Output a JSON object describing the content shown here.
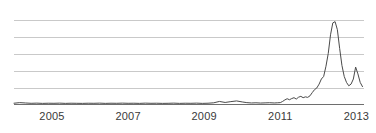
{
  "chart_data": {
    "type": "line",
    "title": "",
    "subtitle": "",
    "xlabel": "",
    "ylabel": "",
    "grid": true,
    "legend": null,
    "xlim": [
      2004.0,
      2013.2
    ],
    "ylim": [
      0,
      100
    ],
    "gridline_values": [
      100,
      80,
      60,
      40,
      20
    ],
    "xticks": [
      2005,
      2007,
      2009,
      2011,
      2013
    ],
    "xtick_labels": [
      "2005",
      "2007",
      "2009",
      "2011",
      "2013"
    ],
    "yticks": [],
    "ytick_labels": [],
    "series": [
      {
        "name": "value",
        "color": "#4a4a4a",
        "x": [
          2004.0,
          2004.15,
          2004.3,
          2004.45,
          2004.6,
          2004.75,
          2004.9,
          2005.05,
          2005.2,
          2005.35,
          2005.5,
          2005.65,
          2005.8,
          2005.95,
          2006.1,
          2006.25,
          2006.4,
          2006.55,
          2006.7,
          2006.85,
          2007.0,
          2007.15,
          2007.3,
          2007.45,
          2007.6,
          2007.75,
          2007.9,
          2008.05,
          2008.2,
          2008.35,
          2008.5,
          2008.65,
          2008.8,
          2008.95,
          2009.1,
          2009.25,
          2009.4,
          2009.55,
          2009.7,
          2009.85,
          2010.0,
          2010.12,
          2010.24,
          2010.36,
          2010.48,
          2010.6,
          2010.72,
          2010.84,
          2010.92,
          2011.0,
          2011.06,
          2011.12,
          2011.18,
          2011.24,
          2011.3,
          2011.36,
          2011.42,
          2011.48,
          2011.54,
          2011.6,
          2011.66,
          2011.72,
          2011.78,
          2011.84,
          2011.9,
          2011.96,
          2012.02,
          2012.08,
          2012.14,
          2012.2,
          2012.26,
          2012.32,
          2012.38,
          2012.44,
          2012.5,
          2012.56,
          2012.62,
          2012.68,
          2012.74,
          2012.8,
          2012.86,
          2012.92,
          2012.98,
          2013.04,
          2013.1,
          2013.16
        ],
        "y": [
          1.5,
          2.2,
          1.8,
          1.4,
          1.6,
          1.3,
          1.5,
          1.4,
          1.6,
          1.3,
          1.5,
          1.4,
          1.3,
          1.5,
          1.4,
          1.6,
          1.3,
          1.5,
          1.4,
          1.6,
          1.4,
          1.5,
          1.3,
          1.6,
          1.4,
          1.5,
          1.3,
          1.4,
          1.6,
          1.3,
          1.5,
          1.4,
          1.6,
          1.3,
          1.5,
          2.0,
          3.6,
          2.4,
          3.4,
          4.2,
          3.0,
          2.2,
          1.8,
          2.0,
          1.7,
          1.9,
          2.1,
          1.8,
          2.0,
          2.2,
          3.6,
          5.4,
          6.8,
          5.6,
          7.0,
          8.0,
          6.4,
          8.6,
          9.6,
          8.0,
          9.0,
          8.4,
          10.2,
          14.0,
          17.5,
          19.5,
          24.0,
          30.0,
          33.0,
          45.0,
          60.0,
          82.0,
          96.0,
          97.5,
          88.0,
          66.0,
          46.0,
          33.0,
          26.0,
          22.0,
          24.0,
          30.0,
          44.0,
          36.0,
          26.0,
          21.0
        ]
      }
    ],
    "annotations": []
  },
  "axis": {
    "tick_labels": [
      "2005",
      "2007",
      "2009",
      "2011",
      "2013"
    ]
  },
  "colors": {
    "line": "#4a4a4a",
    "grid": "#c9c9c9",
    "axis": "#6e6e6e",
    "background": "#ffffff",
    "tick_text": "#3a3a3a"
  }
}
